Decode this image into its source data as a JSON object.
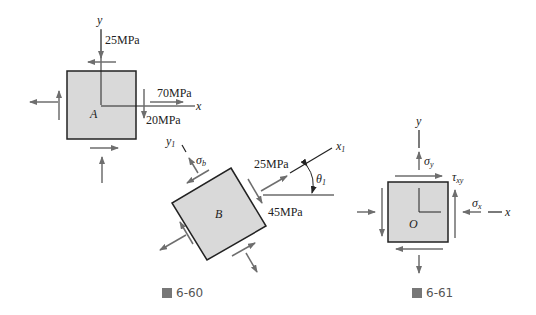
{
  "figures": [
    {
      "id": "6-60",
      "caption_prefix": "圖",
      "caption_number": "6-60",
      "elements": {
        "A": {
          "label": "A",
          "axis_x": "x",
          "axis_y": "y",
          "stress_top": "25MPa",
          "stress_right_normal": "70MPa",
          "stress_right_shear": "20MPa"
        },
        "B": {
          "label": "B",
          "axis_x1": "x",
          "axis_x1_sub": "1",
          "axis_y1": "y",
          "axis_y1_sub": "1",
          "sigma_b": "σ",
          "sigma_b_sub": "b",
          "stress_normal": "25MPa",
          "stress_shear": "45MPa",
          "angle": "θ",
          "angle_sub": "1"
        }
      }
    },
    {
      "id": "6-61",
      "caption_prefix": "圖",
      "caption_number": "6-61",
      "elements": {
        "O": {
          "label": "O",
          "axis_x": "x",
          "axis_y": "y",
          "sigma_y": "σ",
          "sigma_y_sub": "y",
          "sigma_x": "σ",
          "sigma_x_sub": "x",
          "tau": "τ",
          "tau_sub": "xy"
        }
      }
    }
  ],
  "colors": {
    "square_fill": "#d9d9d9",
    "square_stroke": "#222222",
    "arrow": "#6e6e6e",
    "axis": "#222222",
    "text": "#222222",
    "caption": "#555555"
  }
}
